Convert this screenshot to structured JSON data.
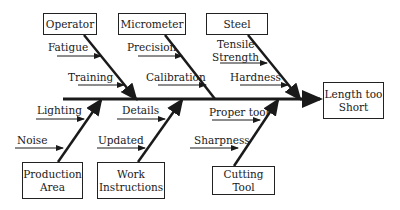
{
  "diagram": {
    "type": "fishbone",
    "effect": {
      "line1": "Length too",
      "line2": "Short"
    },
    "categories": {
      "operator": {
        "label": "Operator",
        "causes": [
          "Fatigue",
          "Training"
        ]
      },
      "micrometer": {
        "label": "Micrometer",
        "causes": [
          "Precision",
          "Calibration"
        ]
      },
      "steel": {
        "label": "Steel",
        "causes": [
          "Tensile Strength",
          "Hardness"
        ],
        "tensile_line1": "Tensile",
        "tensile_line2": "Strength"
      },
      "production_area": {
        "line1": "Production",
        "line2": "Area",
        "causes": [
          "Lighting",
          "Noise"
        ]
      },
      "work_instructions": {
        "line1": "Work",
        "line2": "Instructions",
        "causes": [
          "Details",
          "Updated"
        ]
      },
      "cutting_tool": {
        "line1": "Cutting",
        "line2": "Tool",
        "causes": [
          "Proper tool",
          "Sharpness"
        ]
      }
    },
    "colors": {
      "line": "#1a1a1a",
      "background": "#ffffff"
    }
  }
}
